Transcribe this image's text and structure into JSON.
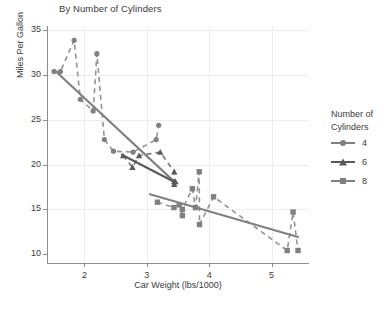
{
  "chart_data": {
    "type": "scatter",
    "title": "By Number of Cylinders",
    "xlabel": "Car Weight (lbs/1000)",
    "ylabel": "Miles Per Gallon",
    "xlim": [
      1.4,
      5.6
    ],
    "ylim": [
      9.0,
      35.5
    ],
    "xticks": [
      2,
      3,
      4,
      5
    ],
    "yticks": [
      10,
      15,
      20,
      25,
      30,
      35
    ],
    "grid": true,
    "legend": {
      "title_line1": "Number of",
      "title_line2": "Cylinders",
      "position": "right",
      "entries": [
        {
          "label": "4",
          "marker": "circle",
          "color": "#808080"
        },
        {
          "label": "6",
          "marker": "triangle",
          "color": "#5a5a5a"
        },
        {
          "label": "8",
          "marker": "square",
          "color": "#808080"
        }
      ]
    },
    "series": [
      {
        "name": "4",
        "marker": "circle",
        "color": "#808080",
        "points": [
          [
            1.513,
            30.4
          ],
          [
            1.615,
            30.4
          ],
          [
            1.835,
            33.9
          ],
          [
            1.935,
            27.3
          ],
          [
            2.14,
            26.0
          ],
          [
            2.2,
            32.4
          ],
          [
            2.32,
            22.8
          ],
          [
            2.465,
            21.5
          ],
          [
            2.78,
            21.4
          ],
          [
            3.15,
            22.8
          ],
          [
            3.19,
            24.4
          ]
        ],
        "trend": {
          "type": "solid",
          "x1": 1.513,
          "y1": 30.6,
          "x2": 3.44,
          "y2": 18.1
        },
        "connector": "dashed"
      },
      {
        "name": "6",
        "marker": "triangle",
        "color": "#5a5a5a",
        "points": [
          [
            2.62,
            21.0
          ],
          [
            2.77,
            19.7
          ],
          [
            2.875,
            21.0
          ],
          [
            3.215,
            21.4
          ],
          [
            3.44,
            19.2
          ],
          [
            3.44,
            18.1
          ],
          [
            3.44,
            17.8
          ],
          [
            3.46,
            18.1
          ]
        ],
        "trend": {
          "type": "solid",
          "x1": 2.6,
          "y1": 21.1,
          "x2": 3.46,
          "y2": 18.0
        },
        "connector": "dashed"
      },
      {
        "name": "8",
        "marker": "square",
        "color": "#808080",
        "points": [
          [
            3.17,
            15.8
          ],
          [
            3.435,
            15.2
          ],
          [
            3.52,
            15.5
          ],
          [
            3.57,
            14.3
          ],
          [
            3.57,
            15.0
          ],
          [
            3.73,
            17.3
          ],
          [
            3.78,
            15.2
          ],
          [
            3.84,
            19.2
          ],
          [
            3.845,
            13.3
          ],
          [
            4.07,
            16.4
          ],
          [
            5.25,
            10.4
          ],
          [
            5.345,
            14.7
          ],
          [
            5.424,
            10.4
          ]
        ],
        "trend": {
          "type": "solid",
          "x1": 3.05,
          "y1": 16.7,
          "x2": 5.424,
          "y2": 11.9
        },
        "connector": "dashed"
      }
    ]
  }
}
